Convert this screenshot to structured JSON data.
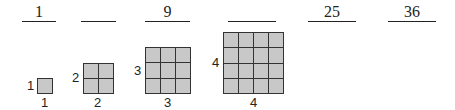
{
  "sequence": {
    "blanks": [
      {
        "value": "1"
      },
      {
        "value": ""
      },
      {
        "value": "9"
      },
      {
        "value": ""
      },
      {
        "value": "25"
      },
      {
        "value": "36"
      }
    ]
  },
  "squares": [
    {
      "n": 1,
      "side_label": "1",
      "bottom_label": "1"
    },
    {
      "n": 2,
      "side_label": "2",
      "bottom_label": "2"
    },
    {
      "n": 3,
      "side_label": "3",
      "bottom_label": "3"
    },
    {
      "n": 4,
      "side_label": "4",
      "bottom_label": "4"
    }
  ],
  "colors": {
    "cell_fill": "#c8c8c8",
    "grid_line": "#333333"
  }
}
